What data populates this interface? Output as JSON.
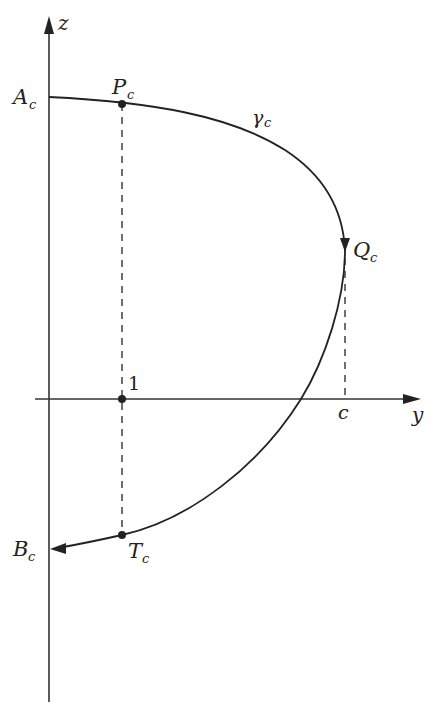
{
  "diagram": {
    "axes": {
      "horizontal": {
        "label": "y",
        "tick_label": "1",
        "c_label": "c"
      },
      "vertical": {
        "label": "z"
      }
    },
    "curve": {
      "label": "γ",
      "label_sub": "c"
    },
    "points": {
      "A": {
        "label": "A",
        "sub": "c"
      },
      "P": {
        "label": "P",
        "sub": "c"
      },
      "Q": {
        "label": "Q",
        "sub": "c"
      },
      "T": {
        "label": "T",
        "sub": "c"
      },
      "B": {
        "label": "B",
        "sub": "c"
      }
    },
    "colors": {
      "stroke": "#222222",
      "background": "#ffffff"
    }
  }
}
